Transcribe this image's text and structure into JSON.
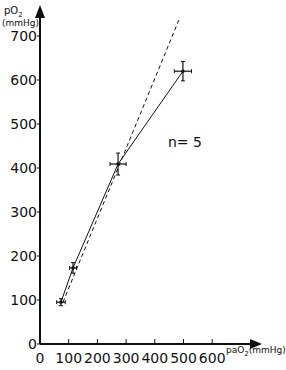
{
  "chart_data": {
    "type": "line",
    "title": "",
    "xlabel": "paO2 (mmHg)",
    "ylabel": "pO2 (mmHg)",
    "xlabel_parts": {
      "main": "paO",
      "sub": "2",
      "unit": "(mmHg)"
    },
    "ylabel_parts": {
      "main": "pO",
      "sub": "2",
      "unit": "(mmHg)"
    },
    "xlim": [
      0,
      760
    ],
    "ylim": [
      0,
      770
    ],
    "x_ticks": [
      0,
      100,
      200,
      300,
      400,
      500,
      600
    ],
    "y_ticks": [
      0,
      100,
      200,
      300,
      400,
      500,
      600,
      700
    ],
    "grid": false,
    "legend": null,
    "annotations": [
      {
        "text": "n= 5",
        "x": 450,
        "y": 440
      }
    ],
    "series": [
      {
        "name": "measured",
        "style": "solid",
        "points": [
          {
            "x": 73,
            "y": 95,
            "xerr": 15,
            "yerr": 8
          },
          {
            "x": 115,
            "y": 173,
            "xerr": 12,
            "yerr": 12
          },
          {
            "x": 272,
            "y": 409,
            "xerr": 28,
            "yerr": 25
          },
          {
            "x": 498,
            "y": 620,
            "xerr": 30,
            "yerr": 22
          }
        ]
      },
      {
        "name": "reference (dashed)",
        "style": "dashed",
        "points": [
          {
            "x": 80,
            "y": 95
          },
          {
            "x": 488,
            "y": 743
          }
        ]
      }
    ]
  }
}
